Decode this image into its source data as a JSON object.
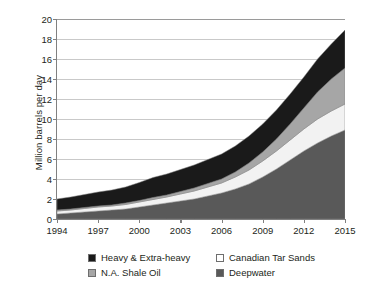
{
  "chart_data": {
    "type": "area",
    "stacked": true,
    "title": "",
    "xlabel": "",
    "ylabel": "Million barrels per day",
    "x": [
      1994,
      1995,
      1996,
      1997,
      1998,
      1999,
      2000,
      2001,
      2002,
      2003,
      2004,
      2005,
      2006,
      2007,
      2008,
      2009,
      2010,
      2011,
      2012,
      2013,
      2014,
      2015
    ],
    "xlim": [
      1994,
      2015
    ],
    "ylim": [
      0,
      20
    ],
    "xticks": [
      "1994",
      "1997",
      "2000",
      "2003",
      "2006",
      "2009",
      "2012",
      "2015"
    ],
    "yticks": [
      "0",
      "2",
      "4",
      "6",
      "8",
      "10",
      "12",
      "14",
      "16",
      "18",
      "20"
    ],
    "grid": true,
    "legend_position": "bottom",
    "stack_order_bottom_to_top": [
      "Deepwater",
      "Canadian Tar Sands",
      "N.A. Shale Oil",
      "Heavy & Extra-heavy"
    ],
    "series": [
      {
        "name": "Deepwater",
        "color": "#595959",
        "values": [
          0.5,
          0.6,
          0.7,
          0.8,
          0.9,
          1.0,
          1.2,
          1.4,
          1.6,
          1.8,
          2.0,
          2.3,
          2.6,
          3.0,
          3.5,
          4.2,
          5.0,
          5.9,
          6.8,
          7.6,
          8.3,
          8.9
        ]
      },
      {
        "name": "Canadian Tar Sands",
        "color": "#f2f2f2",
        "values": [
          0.3,
          0.3,
          0.35,
          0.4,
          0.4,
          0.45,
          0.5,
          0.55,
          0.6,
          0.7,
          0.8,
          0.9,
          1.0,
          1.2,
          1.4,
          1.6,
          1.8,
          2.0,
          2.2,
          2.4,
          2.5,
          2.6
        ]
      },
      {
        "name": "N.A. Shale Oil",
        "color": "#a6a6a6",
        "values": [
          0.1,
          0.1,
          0.1,
          0.1,
          0.1,
          0.15,
          0.15,
          0.2,
          0.2,
          0.25,
          0.3,
          0.35,
          0.4,
          0.5,
          0.7,
          0.9,
          1.2,
          1.6,
          2.1,
          2.7,
          3.2,
          3.6
        ]
      },
      {
        "name": "Heavy & Extra-heavy",
        "color": "#1a1a1a",
        "values": [
          1.1,
          1.2,
          1.3,
          1.4,
          1.5,
          1.6,
          1.8,
          2.0,
          2.1,
          2.2,
          2.3,
          2.4,
          2.5,
          2.6,
          2.7,
          2.8,
          2.9,
          3.0,
          3.1,
          3.3,
          3.5,
          3.8
        ]
      }
    ],
    "totals": [
      2.0,
      2.2,
      2.45,
      2.7,
      2.9,
      3.2,
      3.65,
      4.15,
      4.5,
      4.95,
      5.4,
      5.95,
      6.5,
      7.3,
      8.3,
      9.5,
      10.9,
      12.5,
      14.2,
      16.0,
      17.5,
      18.9
    ]
  },
  "legend": {
    "items": [
      {
        "label": "Heavy & Extra-heavy",
        "color": "#1a1a1a"
      },
      {
        "label": "Canadian Tar Sands",
        "color": "#ffffff"
      },
      {
        "label": "N.A. Shale Oil",
        "color": "#a6a6a6"
      },
      {
        "label": "Deepwater",
        "color": "#595959"
      }
    ]
  }
}
